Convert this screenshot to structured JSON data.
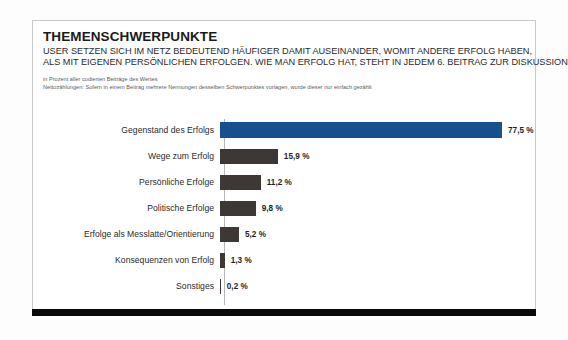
{
  "card": {
    "title": "THEMENSCHWERPUNKTE",
    "subtitle_lines": [
      "USER SETZEN SICH IM NETZ BEDEUTEND HÄUFIGER DAMIT AUSEINANDER, WOMIT ANDERE ERFOLG HABEN,",
      "ALS MIT EIGENEN PERSÖNLICHEN ERFOLGEN. WIE MAN ERFOLG HAT, STEHT IN JEDEM 6. BEITRAG ZUR DISKUSSION."
    ],
    "note_lines": [
      "in Prozent aller codierten Beiträge des Wertes",
      "Nettozählungen: Sofern in einem Beitrag mehrere Nennungen desselben Schwerpunktes vorlagen, wurde dieser nur einfach gezählt"
    ]
  },
  "colors": {
    "highlight_bar": "#17508f",
    "default_bar": "#3d3835",
    "footer_bar": "#0a0a0a",
    "card_border": "#c9c9c9"
  },
  "chart_data": {
    "type": "bar",
    "orientation": "horizontal",
    "title": "THEMENSCHWERPUNKTE",
    "xlabel": "",
    "ylabel": "",
    "xlim": [
      0,
      77.5
    ],
    "grid": false,
    "legend": null,
    "value_suffix": "%",
    "categories": [
      "Gegenstand des Erfolgs",
      "Wege zum Erfolg",
      "Persönliche Erfolge",
      "Politische Erfolge",
      "Erfolge als Messlatte/Orientierung",
      "Konsequenzen von Erfolg",
      "Sonstiges"
    ],
    "values": [
      77.5,
      15.9,
      11.2,
      9.8,
      5.2,
      1.3,
      0.2
    ],
    "value_labels": [
      "77,5 %",
      "15,9 %",
      "11,2 %",
      "9,8 %",
      "5,2 %",
      "1,3 %",
      "0,2 %"
    ],
    "highlight_index": 0
  }
}
